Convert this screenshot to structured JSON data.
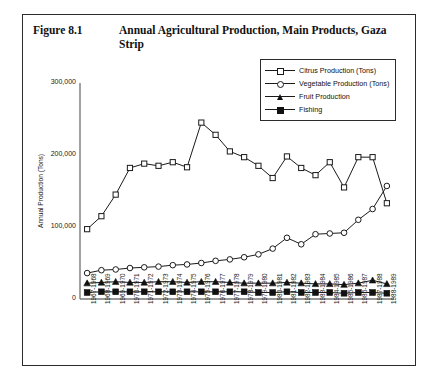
{
  "figure": {
    "number": "Figure 8.1",
    "title": "Annual Agricultural Production, Main Products, Gaza Strip"
  },
  "legend": {
    "position": "top-right",
    "items": [
      {
        "label": "Citrus Production (Tons)",
        "marker": "open-square-marker"
      },
      {
        "label": "Vegetable Production (Tons)",
        "marker": "open-circle-marker"
      },
      {
        "label": "Fruit Production",
        "marker": "filled-triangle-marker"
      },
      {
        "label": "Fishing",
        "marker": "filled-square-marker"
      }
    ]
  },
  "chart_data": {
    "type": "line",
    "title": "Annual Agricultural Production, Main Products, Gaza Strip",
    "xlabel": "",
    "ylabel": "Annual Production (Tons)",
    "ylim": [
      0,
      300000
    ],
    "yticks": [
      0,
      100000,
      200000,
      300000
    ],
    "ytick_labels": [
      "0",
      "100,000",
      "200,000",
      "300,000"
    ],
    "grid": false,
    "legend_position": "top-right",
    "categories": [
      "1967-1968",
      "1968-1969",
      "1969-1970",
      "1970-1971",
      "1971-1972",
      "1972-1973",
      "1973-1974",
      "1974-1975",
      "1975-1976",
      "1976-1977",
      "1977-1978",
      "1978-1979",
      "1979-1980",
      "1980-1981",
      "1981-1982",
      "1982-1983",
      "1983-1984",
      "1984-1985",
      "1985-1986",
      "1986-1987",
      "1987-1988",
      "1988-1989"
    ],
    "series": [
      {
        "name": "Citrus Production (Tons)",
        "marker": "open-square",
        "values": [
          97000,
          115000,
          145000,
          182000,
          188000,
          185000,
          190000,
          183000,
          245000,
          228000,
          205000,
          197000,
          185000,
          168000,
          198000,
          182000,
          172000,
          190000,
          155000,
          197000,
          197000,
          133000
        ]
      },
      {
        "name": "Vegetable Production (Tons)",
        "marker": "open-circle",
        "values": [
          36000,
          40000,
          41000,
          43000,
          44000,
          45000,
          47000,
          48000,
          50000,
          53000,
          55000,
          58000,
          62000,
          70000,
          85000,
          76000,
          90000,
          91000,
          92000,
          110000,
          125000,
          157000
        ]
      },
      {
        "name": "Fruit Production",
        "marker": "filled-triangle",
        "values": [
          22000,
          23000,
          24000,
          23000,
          23000,
          24000,
          24000,
          23000,
          24000,
          24000,
          23000,
          22000,
          22000,
          22000,
          23000,
          22000,
          21000,
          21000,
          20000,
          22000,
          26000,
          21000
        ]
      },
      {
        "name": "Fishing",
        "marker": "filled-square",
        "values": [
          9000,
          10000,
          10000,
          10000,
          10000,
          10000,
          10000,
          10000,
          10000,
          10000,
          10000,
          10000,
          9000,
          9000,
          10000,
          9000,
          9000,
          9000,
          8000,
          9000,
          9000,
          8000
        ]
      }
    ]
  }
}
